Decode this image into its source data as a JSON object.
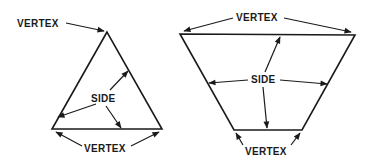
{
  "figure": {
    "triangle": {
      "vertex_labels": [
        "VERTEX",
        "VERTEX"
      ],
      "side_label": "SIDE"
    },
    "trapezoid": {
      "vertex_labels": [
        "VERTEX",
        "VERTEX"
      ],
      "side_label": "SIDE"
    }
  },
  "colors": {
    "ink": "#1a1a1a",
    "background": "#ffffff"
  }
}
